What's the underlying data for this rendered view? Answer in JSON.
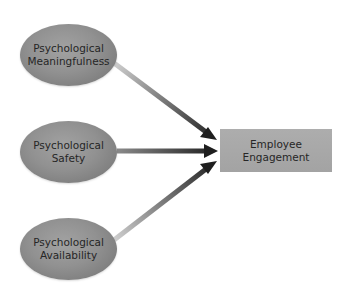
{
  "diagram": {
    "type": "flow",
    "inputs": [
      {
        "id": "meaningfulness",
        "lines": [
          "Psychological",
          "Meaningfulness"
        ]
      },
      {
        "id": "safety",
        "lines": [
          "Psychological",
          "Safety"
        ]
      },
      {
        "id": "availability",
        "lines": [
          "Psychological",
          "Availability"
        ]
      }
    ],
    "output": {
      "id": "engagement",
      "lines": [
        "Employee",
        "Engagement"
      ]
    },
    "edges": [
      {
        "from": "meaningfulness",
        "to": "engagement"
      },
      {
        "from": "safety",
        "to": "engagement"
      },
      {
        "from": "availability",
        "to": "engagement"
      }
    ],
    "colors": {
      "node_fill": "#919191",
      "box_fill": "#a8a8a8",
      "text": "#262626",
      "arrow_start": "#c8c8c8",
      "arrow_end": "#1e1e1e"
    }
  }
}
